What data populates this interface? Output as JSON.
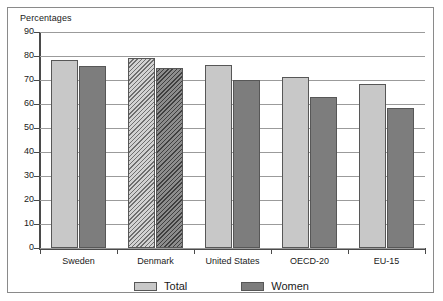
{
  "chart_data": {
    "type": "bar",
    "title": "",
    "ylabel": "Percentages",
    "xlabel": "",
    "ylim": [
      0,
      90
    ],
    "ytick_step": 10,
    "grid": true,
    "legend_position": "bottom",
    "yticks": [
      "90",
      "80",
      "70",
      "60",
      "50",
      "40",
      "30",
      "20",
      "10",
      "0"
    ],
    "categories": [
      "Sweden",
      "Denmark",
      "United States",
      "OECD-20",
      "EU-15"
    ],
    "series": [
      {
        "name": "Total",
        "color": "#c8c8c8",
        "values": [
          78.3,
          79.2,
          76.3,
          71.3,
          68.5
        ]
      },
      {
        "name": "Women",
        "color": "#7d7d7d",
        "values": [
          75.8,
          75.2,
          70.0,
          63.0,
          58.5
        ]
      }
    ],
    "hatched_categories": [
      "Denmark"
    ]
  },
  "legend": {
    "items": [
      {
        "label": "Total",
        "swatch": "total"
      },
      {
        "label": "Women",
        "swatch": "women"
      }
    ]
  }
}
